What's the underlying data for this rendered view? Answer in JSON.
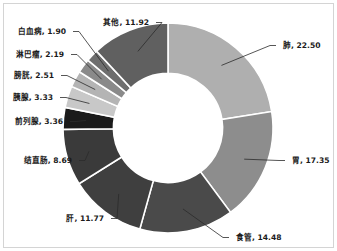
{
  "chart_data": {
    "type": "pie",
    "variant": "donut",
    "title": "",
    "subtitle": "",
    "xlabel": "",
    "ylabel": "",
    "grid": false,
    "legend_position": "none",
    "label_format": "name, value",
    "start_angle_deg": 0,
    "direction": "clockwise",
    "inner_radius_ratio": 0.52,
    "total": 100.0,
    "categories": [
      "肺",
      "胃",
      "食管",
      "肝",
      "结直肠",
      "前列腺",
      "胰腺",
      "膀胱",
      "淋巴瘤",
      "白血病",
      "其他"
    ],
    "values": [
      22.5,
      17.35,
      14.48,
      11.77,
      8.69,
      3.36,
      3.33,
      2.51,
      2.19,
      1.9,
      11.92
    ],
    "colors": [
      "#afafaf",
      "#8d8d8d",
      "#4a4a4a",
      "#3f3f3f",
      "#3a3a3a",
      "#1a1a1a",
      "#c8c8c8",
      "#b4b4b4",
      "#8a8a8a",
      "#6e6e6e",
      "#606060"
    ],
    "slices": [
      {
        "label": "肺",
        "value": 22.5,
        "text": "肺, 22.50",
        "color": "#afafaf",
        "side": "right"
      },
      {
        "label": "胃",
        "value": 17.35,
        "text": "胃, 17.35",
        "color": "#8d8d8d",
        "side": "right"
      },
      {
        "label": "食管",
        "value": 14.48,
        "text": "食管, 14.48",
        "color": "#4a4a4a",
        "side": "right"
      },
      {
        "label": "肝",
        "value": 11.77,
        "text": "肝, 11.77",
        "color": "#3f3f3f",
        "side": "left"
      },
      {
        "label": "结直肠",
        "value": 8.69,
        "text": "结直肠, 8.69",
        "color": "#3a3a3a",
        "side": "left"
      },
      {
        "label": "前列腺",
        "value": 3.36,
        "text": "前列腺, 3.36",
        "color": "#1a1a1a",
        "side": "left"
      },
      {
        "label": "胰腺",
        "value": 3.33,
        "text": "胰腺, 3.33",
        "color": "#c8c8c8",
        "side": "left"
      },
      {
        "label": "膀胱",
        "value": 2.51,
        "text": "膀胱, 2.51",
        "color": "#b4b4b4",
        "side": "left"
      },
      {
        "label": "淋巴瘤",
        "value": 2.19,
        "text": "淋巴瘤, 2.19",
        "color": "#8a8a8a",
        "side": "left"
      },
      {
        "label": "白血病",
        "value": 1.9,
        "text": "白血病, 1.90",
        "color": "#6e6e6e",
        "side": "left"
      },
      {
        "label": "其他",
        "value": 11.92,
        "text": "其他, 11.92",
        "color": "#606060",
        "side": "left"
      }
    ]
  },
  "figure": {
    "background_color": "#ffffff",
    "border_color": "#d4d4d4",
    "slice_border_color": "#ffffff"
  }
}
